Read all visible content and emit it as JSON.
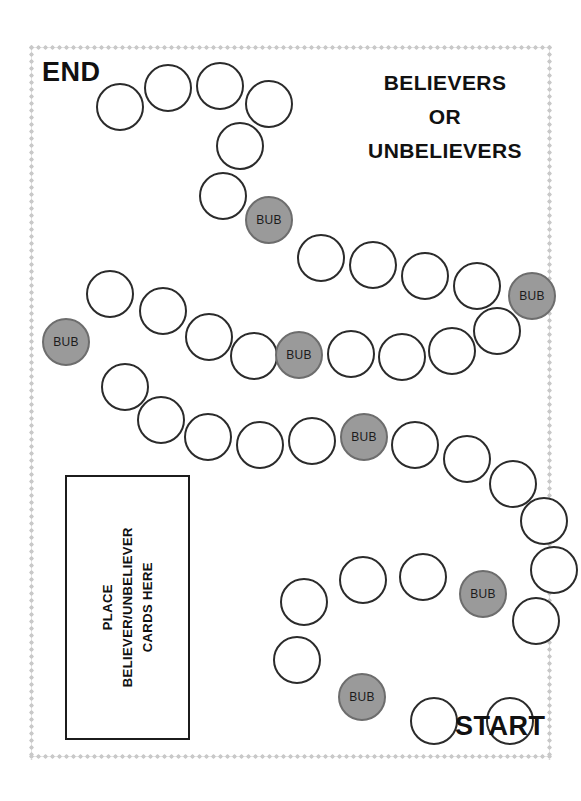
{
  "board": {
    "title_lines": [
      "BELIEVERS",
      "OR",
      "UNBELIEVERS"
    ],
    "end_label": "END",
    "start_label": "START",
    "card_box": {
      "lines": [
        "PLACE",
        "BELIEVER/UNBELIEVER",
        "CARDS HERE"
      ]
    },
    "colors": {
      "space_outline": "#2b2b2b",
      "space_fill": "#ffffff",
      "bub_fill": "#9a9a9a",
      "bub_outline": "#6d6d6d",
      "text": "#111111",
      "frame": "#c9c9c9",
      "background": "#ffffff"
    },
    "bub_label": "BUB",
    "counts": {
      "total_spaces": 41,
      "plain_spaces": 35,
      "bub_spaces": 6
    },
    "spaces": [
      {
        "index": 1,
        "type": "plain",
        "label": "",
        "x": 486,
        "y": 697,
        "size": 48
      },
      {
        "index": 2,
        "type": "plain",
        "label": "",
        "x": 410,
        "y": 697,
        "size": 48
      },
      {
        "index": 3,
        "type": "bub",
        "label": "BUB",
        "x": 338,
        "y": 673,
        "size": 48
      },
      {
        "index": 4,
        "type": "plain",
        "label": "",
        "x": 273,
        "y": 636,
        "size": 48
      },
      {
        "index": 5,
        "type": "plain",
        "label": "",
        "x": 280,
        "y": 578,
        "size": 48
      },
      {
        "index": 6,
        "type": "plain",
        "label": "",
        "x": 339,
        "y": 556,
        "size": 48
      },
      {
        "index": 7,
        "type": "plain",
        "label": "",
        "x": 399,
        "y": 553,
        "size": 48
      },
      {
        "index": 8,
        "type": "bub",
        "label": "BUB",
        "x": 459,
        "y": 570,
        "size": 48
      },
      {
        "index": 9,
        "type": "plain",
        "label": "",
        "x": 512,
        "y": 597,
        "size": 48
      },
      {
        "index": 10,
        "type": "plain",
        "label": "",
        "x": 530,
        "y": 546,
        "size": 48
      },
      {
        "index": 11,
        "type": "plain",
        "label": "",
        "x": 520,
        "y": 497,
        "size": 48
      },
      {
        "index": 12,
        "type": "plain",
        "label": "",
        "x": 489,
        "y": 460,
        "size": 48
      },
      {
        "index": 13,
        "type": "plain",
        "label": "",
        "x": 443,
        "y": 435,
        "size": 48
      },
      {
        "index": 14,
        "type": "plain",
        "label": "",
        "x": 391,
        "y": 421,
        "size": 48
      },
      {
        "index": 15,
        "type": "bub",
        "label": "BUB",
        "x": 340,
        "y": 413,
        "size": 48
      },
      {
        "index": 16,
        "type": "plain",
        "label": "",
        "x": 288,
        "y": 417,
        "size": 48
      },
      {
        "index": 17,
        "type": "plain",
        "label": "",
        "x": 236,
        "y": 421,
        "size": 48
      },
      {
        "index": 18,
        "type": "plain",
        "label": "",
        "x": 184,
        "y": 413,
        "size": 48
      },
      {
        "index": 19,
        "type": "plain",
        "label": "",
        "x": 137,
        "y": 396,
        "size": 48
      },
      {
        "index": 20,
        "type": "plain",
        "label": "",
        "x": 101,
        "y": 363,
        "size": 48
      },
      {
        "index": 21,
        "type": "bub",
        "label": "BUB",
        "x": 42,
        "y": 318,
        "size": 48
      },
      {
        "index": 22,
        "type": "plain",
        "label": "",
        "x": 86,
        "y": 270,
        "size": 48
      },
      {
        "index": 23,
        "type": "plain",
        "label": "",
        "x": 139,
        "y": 287,
        "size": 48
      },
      {
        "index": 24,
        "type": "plain",
        "label": "",
        "x": 185,
        "y": 313,
        "size": 48
      },
      {
        "index": 25,
        "type": "plain",
        "label": "",
        "x": 230,
        "y": 332,
        "size": 48
      },
      {
        "index": 26,
        "type": "bub",
        "label": "BUB",
        "x": 275,
        "y": 331,
        "size": 48
      },
      {
        "index": 27,
        "type": "plain",
        "label": "",
        "x": 327,
        "y": 330,
        "size": 48
      },
      {
        "index": 28,
        "type": "plain",
        "label": "",
        "x": 378,
        "y": 333,
        "size": 48
      },
      {
        "index": 29,
        "type": "plain",
        "label": "",
        "x": 428,
        "y": 327,
        "size": 48
      },
      {
        "index": 30,
        "type": "plain",
        "label": "",
        "x": 473,
        "y": 307,
        "size": 48
      },
      {
        "index": 31,
        "type": "bub",
        "label": "BUB",
        "x": 508,
        "y": 272,
        "size": 48
      },
      {
        "index": 32,
        "type": "plain",
        "label": "",
        "x": 453,
        "y": 262,
        "size": 48
      },
      {
        "index": 33,
        "type": "plain",
        "label": "",
        "x": 401,
        "y": 252,
        "size": 48
      },
      {
        "index": 34,
        "type": "plain",
        "label": "",
        "x": 349,
        "y": 241,
        "size": 48
      },
      {
        "index": 35,
        "type": "plain",
        "label": "",
        "x": 297,
        "y": 234,
        "size": 48
      },
      {
        "index": 36,
        "type": "bub",
        "label": "BUB",
        "x": 245,
        "y": 196,
        "size": 48
      },
      {
        "index": 37,
        "type": "plain",
        "label": "",
        "x": 199,
        "y": 172,
        "size": 48
      },
      {
        "index": 38,
        "type": "plain",
        "label": "",
        "x": 216,
        "y": 122,
        "size": 48
      },
      {
        "index": 39,
        "type": "plain",
        "label": "",
        "x": 245,
        "y": 80,
        "size": 48
      },
      {
        "index": 40,
        "type": "plain",
        "label": "",
        "x": 196,
        "y": 62,
        "size": 48
      },
      {
        "index": 41,
        "type": "plain",
        "label": "",
        "x": 144,
        "y": 64,
        "size": 48
      },
      {
        "index": 42,
        "type": "plain",
        "label": "",
        "x": 96,
        "y": 83,
        "size": 48
      }
    ]
  }
}
